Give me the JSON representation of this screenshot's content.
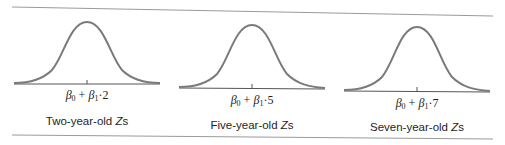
{
  "figure": {
    "panels": [
      {
        "id": "two",
        "center_label": {
          "b0": "β",
          "b0_sub": "0",
          "plus": "+",
          "b1": "β",
          "b1_sub": "1",
          "dot": "·",
          "age": "2"
        },
        "caption_prefix": "Two-year-old ",
        "caption_var": "Z",
        "caption_suffix": "s"
      },
      {
        "id": "five",
        "center_label": {
          "b0": "β",
          "b0_sub": "0",
          "plus": "+",
          "b1": "β",
          "b1_sub": "1",
          "dot": "·",
          "age": "5"
        },
        "caption_prefix": "Five-year-old ",
        "caption_var": "Z",
        "caption_suffix": "s"
      },
      {
        "id": "seven",
        "center_label": {
          "b0": "β",
          "b0_sub": "0",
          "plus": "+",
          "b1": "β",
          "b1_sub": "1",
          "dot": "·",
          "age": "7"
        },
        "caption_prefix": "Seven-year-old ",
        "caption_var": "Z",
        "caption_suffix": "s"
      }
    ],
    "colors": {
      "curve": "#7a7a7a",
      "axis": "#555555",
      "rule": "#9a9a9a"
    }
  }
}
